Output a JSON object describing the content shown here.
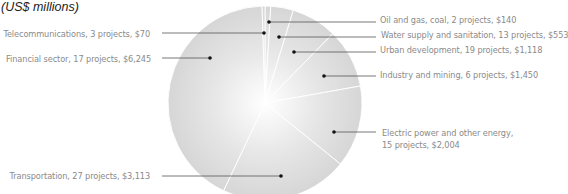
{
  "unit_label": "(US$ millions)",
  "chart_data": {
    "type": "pie",
    "title": "",
    "unit": "US$ millions",
    "categories": [
      "Oil and gas, coal",
      "Water supply and sanitation",
      "Urban development",
      "Industry and mining",
      "Electric power and other energy",
      "Transportation",
      "Financial sector",
      "Telecommunications"
    ],
    "values": [
      140,
      553,
      1118,
      1450,
      2004,
      3113,
      6245,
      70
    ],
    "projects": [
      2,
      13,
      19,
      6,
      15,
      27,
      17,
      3
    ],
    "legend_position": "callout labels"
  },
  "labels": {
    "oil": "Oil and gas, coal, 2 projects, $140",
    "water": "Water supply and sanitation, 13 projects, $553",
    "urban": "Urban development, 19 projects, $1,118",
    "industry": "Industry and mining, 6 projects, $1,450",
    "electric_1": "Electric power and other energy,",
    "electric_2": "15 projects, $2,004",
    "transport": "Transportation, 27 projects, $3,113",
    "financial": "Financial sector, 17 projects, $6,245",
    "telecom": "Telecommunications, 3 projects, $70"
  }
}
